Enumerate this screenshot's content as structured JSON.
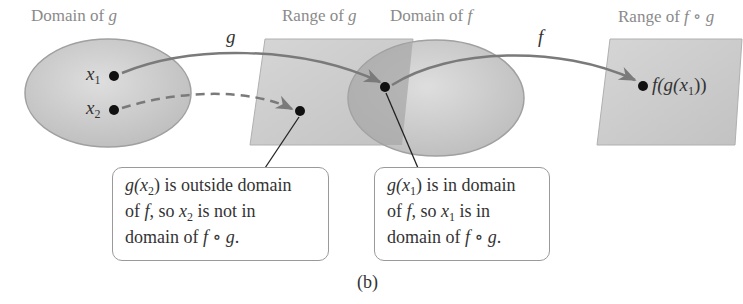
{
  "figure": {
    "caption": "(b)",
    "labels": {
      "domain_g": {
        "prefix": "Domain of ",
        "var": "g"
      },
      "range_g": {
        "prefix": "Range of ",
        "var": "g"
      },
      "domain_f": {
        "prefix": "Domain of ",
        "var": "f"
      },
      "range_fg": {
        "prefix": "Range of ",
        "var": "f ∘ g"
      }
    },
    "arrows": {
      "g_label": "g",
      "f_label": "f"
    },
    "points": {
      "x1": {
        "base": "x",
        "sub": "1"
      },
      "x2": {
        "base": "x",
        "sub": "2"
      },
      "result": {
        "pre": "f(g(x",
        "sub": "1",
        "post": "))"
      }
    },
    "callouts": [
      {
        "line1_pre": "g(x",
        "line1_sub": "2",
        "line1_post": ") is outside domain",
        "line2_pre": "of ",
        "line2_var": "f",
        "line2_mid": ", so ",
        "line2_x": "x",
        "line2_sub": "2",
        "line2_post": " is not in",
        "line3_pre": "domain of ",
        "line3_var": "f ∘ g",
        "line3_post": "."
      },
      {
        "line1_pre": "g(x",
        "line1_sub": "1",
        "line1_post": ") is in domain",
        "line2_pre": "of ",
        "line2_var": "f",
        "line2_mid": ", so ",
        "line2_x": "x",
        "line2_sub": "1",
        "line2_post": " is in",
        "line3_pre": "domain of ",
        "line3_var": "f ∘ g",
        "line3_post": "."
      }
    ],
    "colors": {
      "shape_fill": "#c8c8c8",
      "overlap_fill": "#a8a8a8",
      "arrow": "#7a7a7a",
      "label_gray": "#8a8a8a"
    }
  }
}
